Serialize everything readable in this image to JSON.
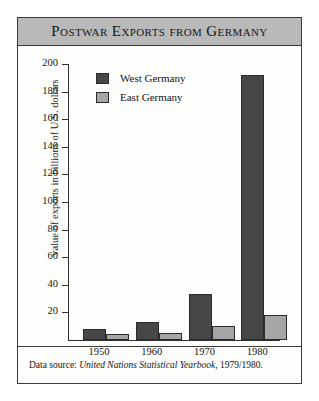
{
  "figure": {
    "title": "Postwar Exports from Germany",
    "source_prefix": "Data source:",
    "source_italic": "United Nations Statistical Yearbook",
    "source_suffix": ", 1979/1980."
  },
  "colors": {
    "title_band": "#b9b9b9",
    "frame": "#3a3a3a",
    "west_germany": "#474747",
    "east_germany": "#a6a6a6",
    "page": "#fdfdfb"
  },
  "chart_data": {
    "type": "bar",
    "title": "Postwar Exports from Germany",
    "xlabel": "",
    "ylabel": "value of exports in billions of U.S. dollars",
    "categories": [
      "1950",
      "1960",
      "1970",
      "1980"
    ],
    "series": [
      {
        "name": "West Germany",
        "color": "#474747",
        "values": [
          8,
          13,
          33,
          192
        ]
      },
      {
        "name": "East Germany",
        "color": "#a6a6a6",
        "values": [
          4,
          5,
          10,
          18
        ]
      }
    ],
    "ylim": [
      0,
      200
    ],
    "yticks": [
      20,
      40,
      60,
      80,
      100,
      120,
      140,
      160,
      180,
      200
    ],
    "ytick_labels": [
      "20",
      "40",
      "60",
      "80",
      "100",
      "120",
      "140",
      "160",
      "180",
      "200"
    ],
    "grid": false,
    "legend_position": "upper-left-inside",
    "annotations": [
      "Data source: United Nations Statistical Yearbook, 1979/1980."
    ]
  }
}
